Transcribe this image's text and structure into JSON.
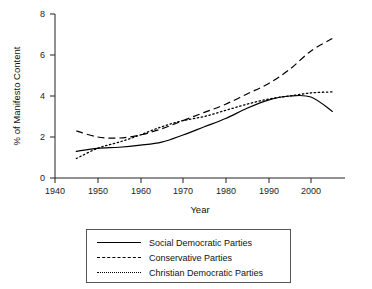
{
  "chart_data": {
    "type": "line",
    "title": "",
    "xlabel": "Year",
    "ylabel": "% of Manifesto Content",
    "xlim": [
      1940,
      2008
    ],
    "ylim": [
      0,
      8
    ],
    "xticks": [
      1940,
      1950,
      1960,
      1970,
      1980,
      1990,
      2000
    ],
    "yticks": [
      0,
      2,
      4,
      6,
      8
    ],
    "grid": false,
    "legend_position": "below-center",
    "series": [
      {
        "name": "Social Democratic Parties",
        "style": "solid",
        "x": [
          1945,
          1950,
          1955,
          1960,
          1965,
          1970,
          1975,
          1980,
          1985,
          1990,
          1995,
          2000,
          2005
        ],
        "y": [
          1.3,
          1.45,
          1.5,
          1.6,
          1.75,
          2.1,
          2.5,
          2.9,
          3.4,
          3.8,
          4.0,
          3.95,
          3.25
        ]
      },
      {
        "name": "Conservative Parties",
        "style": "dashed",
        "x": [
          1945,
          1950,
          1955,
          1960,
          1965,
          1970,
          1975,
          1980,
          1985,
          1990,
          1995,
          2000,
          2005
        ],
        "y": [
          2.3,
          2.0,
          1.95,
          2.1,
          2.4,
          2.8,
          3.2,
          3.6,
          4.1,
          4.6,
          5.3,
          6.2,
          6.8
        ]
      },
      {
        "name": "Christian Democratic Parties",
        "style": "dotted",
        "x": [
          1945,
          1950,
          1955,
          1960,
          1965,
          1970,
          1975,
          1980,
          1985,
          1990,
          1995,
          2000,
          2005
        ],
        "y": [
          0.95,
          1.45,
          1.75,
          2.1,
          2.5,
          2.8,
          3.0,
          3.3,
          3.6,
          3.85,
          4.0,
          4.15,
          4.2
        ]
      }
    ]
  },
  "axes": {
    "x_title": "Year",
    "y_title": "% of Manifesto Content",
    "x_tick_labels": [
      "1940",
      "1950",
      "1960",
      "1970",
      "1980",
      "1990",
      "2000"
    ],
    "y_tick_labels": [
      "0",
      "2",
      "4",
      "6",
      "8"
    ]
  },
  "legend": {
    "items": [
      {
        "label": "Social Democratic Parties",
        "style": "solid"
      },
      {
        "label": "Conservative Parties",
        "style": "dashed"
      },
      {
        "label": "Christian Democratic Parties",
        "style": "dotted"
      }
    ]
  }
}
